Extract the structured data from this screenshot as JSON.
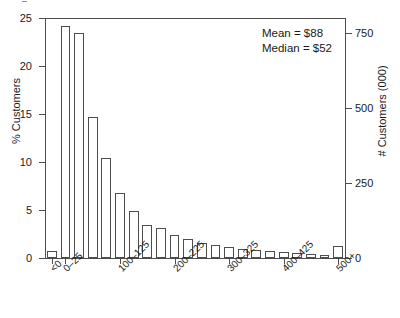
{
  "chart_data": {
    "type": "bar",
    "title": "",
    "subtitle": "",
    "xlabel": "",
    "ylabel": "% Customers",
    "ylabel_right": "# Customers (000)",
    "ylim": [
      0,
      25
    ],
    "ylim_right": [
      0,
      800
    ],
    "grid": false,
    "legend": "none",
    "yticks": [
      0,
      5,
      10,
      15,
      20,
      25
    ],
    "yticks_right": [
      0,
      250,
      500,
      750
    ],
    "categories": [
      "<0",
      "0-25",
      "25-50",
      "50-75",
      "75-100",
      "100-125",
      "125-150",
      "150-175",
      "175-200",
      "200-225",
      "225-250",
      "250-275",
      "275-300",
      "300-325",
      "325-350",
      "350-375",
      "375-400",
      "400-425",
      "425-450",
      "450-475",
      "475-500",
      "500+"
    ],
    "values": [
      0.7,
      24.2,
      23.4,
      14.7,
      10.4,
      6.8,
      4.9,
      3.4,
      3.1,
      2.4,
      2.0,
      1.6,
      1.4,
      1.1,
      0.9,
      0.8,
      0.7,
      0.6,
      0.5,
      0.4,
      0.35,
      1.3
    ],
    "xtick_labels": [
      "<0",
      "0-25",
      "100-125",
      "200-225",
      "300-325",
      "400-425",
      "500+"
    ],
    "xtick_categories": [
      "<0",
      "0-25",
      "100-125",
      "200-225",
      "300-325",
      "400-425",
      "500+"
    ],
    "annotations": [
      {
        "name": "mean",
        "text": "Mean = $88"
      },
      {
        "name": "median",
        "text": "Median = $52"
      }
    ],
    "colors": {
      "bar_fill": "#ffffff",
      "bar_stroke": "#4d4d4d",
      "axis": "#4d4d4d",
      "text": "#1a1a1a"
    }
  }
}
